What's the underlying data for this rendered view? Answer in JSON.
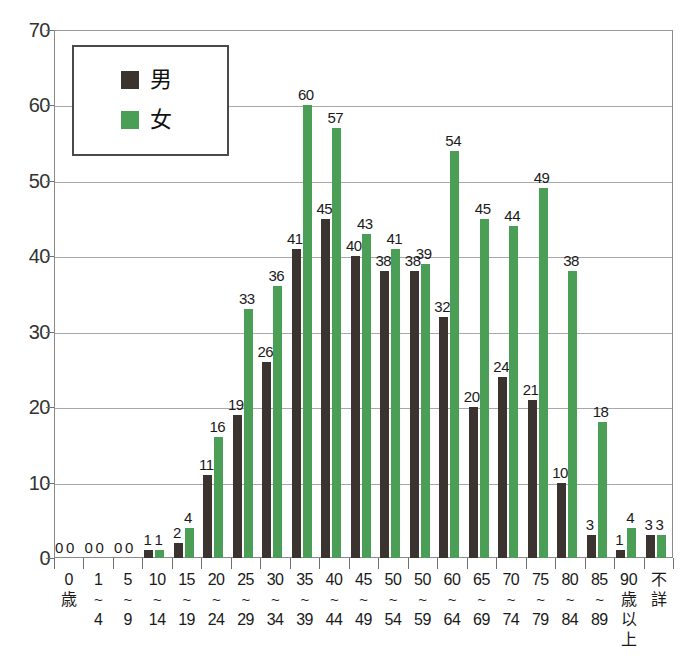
{
  "chart_data": {
    "type": "bar",
    "title": "",
    "xlabel": "",
    "ylabel": "",
    "ylim": [
      0,
      70
    ],
    "y_ticks": [
      0,
      10,
      20,
      30,
      40,
      50,
      60,
      70
    ],
    "grid": true,
    "legend_position": "top-left",
    "categories": [
      "0歳",
      "1~4",
      "5~9",
      "10~14",
      "15~19",
      "20~24",
      "25~29",
      "30~34",
      "35~39",
      "40~44",
      "45~49",
      "50~54",
      "50~59",
      "60~64",
      "65~69",
      "70~74",
      "75~79",
      "80~84",
      "85~89",
      "90歳以上",
      "不詳"
    ],
    "category_lines": [
      [
        "0",
        "歳"
      ],
      [
        "1",
        "~",
        "4"
      ],
      [
        "5",
        "~",
        "9"
      ],
      [
        "10",
        "~",
        "14"
      ],
      [
        "15",
        "~",
        "19"
      ],
      [
        "20",
        "~",
        "24"
      ],
      [
        "25",
        "~",
        "29"
      ],
      [
        "30",
        "~",
        "34"
      ],
      [
        "35",
        "~",
        "39"
      ],
      [
        "40",
        "~",
        "44"
      ],
      [
        "45",
        "~",
        "49"
      ],
      [
        "50",
        "~",
        "54"
      ],
      [
        "50",
        "~",
        "59"
      ],
      [
        "60",
        "~",
        "64"
      ],
      [
        "65",
        "~",
        "69"
      ],
      [
        "70",
        "~",
        "74"
      ],
      [
        "75",
        "~",
        "79"
      ],
      [
        "80",
        "~",
        "84"
      ],
      [
        "85",
        "~",
        "89"
      ],
      [
        "90",
        "歳",
        "以",
        "上"
      ],
      [
        "不",
        "詳"
      ]
    ],
    "series": [
      {
        "name": "男",
        "color": "#3b3330",
        "values": [
          0,
          0,
          0,
          1,
          2,
          11,
          19,
          26,
          41,
          45,
          40,
          38,
          38,
          32,
          20,
          24,
          21,
          10,
          3,
          1,
          3
        ]
      },
      {
        "name": "女",
        "color": "#4a9e55",
        "values": [
          0,
          0,
          0,
          1,
          4,
          16,
          33,
          36,
          60,
          57,
          43,
          41,
          39,
          54,
          45,
          44,
          49,
          38,
          18,
          4,
          3
        ]
      }
    ]
  },
  "legend": {
    "items": [
      {
        "label": "男",
        "color": "#3b3330"
      },
      {
        "label": "女",
        "color": "#4a9e55"
      }
    ]
  },
  "colors": {
    "male": "#3b3330",
    "female": "#4a9e55",
    "grid": "#a8a8a8",
    "axis": "#8a8a8a",
    "text": "#1a1a1a"
  }
}
